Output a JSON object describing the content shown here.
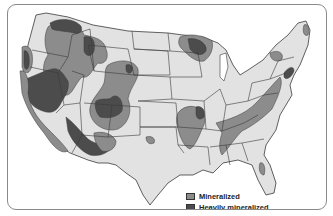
{
  "map": {
    "title": "Mineralized regions of the conterminous United States",
    "caption_partial": "",
    "colors": {
      "land": "#e2e2e2",
      "state_border": "#3a3a3a",
      "mineralized": "#8c8c8c",
      "heavily_mineralized": "#4c4c4c",
      "water": "#ffffff"
    },
    "legend": {
      "items": [
        {
          "label": "Mineralized",
          "category": "mineralized"
        },
        {
          "label": "Heavily mineralized",
          "category": "heavily_mineralized"
        }
      ]
    },
    "regions": [
      {
        "name": "Northern Rockies / Idaho-Montana belt",
        "category": "mineralized"
      },
      {
        "name": "Northern Idaho / NE Washington",
        "category": "heavily_mineralized"
      },
      {
        "name": "Western Montana",
        "category": "heavily_mineralized"
      },
      {
        "name": "Oregon Cascades",
        "category": "mineralized"
      },
      {
        "name": "Klamath / Western Oregon",
        "category": "heavily_mineralized"
      },
      {
        "name": "Great Basin (Nevada)",
        "category": "heavily_mineralized"
      },
      {
        "name": "Sierra Nevada / California",
        "category": "mineralized"
      },
      {
        "name": "Colorado Mineral Belt",
        "category": "mineralized"
      },
      {
        "name": "Central Colorado",
        "category": "heavily_mineralized"
      },
      {
        "name": "Black Hills / Wyoming",
        "category": "heavily_mineralized"
      },
      {
        "name": "Arizona / Southern California",
        "category": "heavily_mineralized"
      },
      {
        "name": "Southwest New Mexico",
        "category": "mineralized"
      },
      {
        "name": "Lake Superior region",
        "category": "mineralized"
      },
      {
        "name": "Upper Peninsula / N. Wisconsin",
        "category": "heavily_mineralized"
      },
      {
        "name": "Ozarks / Southeast Missouri",
        "category": "mineralized"
      },
      {
        "name": "Southeast Missouri Lead Belt",
        "category": "heavily_mineralized"
      },
      {
        "name": "Appalachians",
        "category": "mineralized"
      },
      {
        "name": "Southern Oklahoma",
        "category": "mineralized"
      },
      {
        "name": "Adirondacks",
        "category": "mineralized"
      },
      {
        "name": "Northern Maine",
        "category": "mineralized"
      },
      {
        "name": "Northeast Florida coast",
        "category": "mineralized"
      },
      {
        "name": "New Jersey / Pennsylvania",
        "category": "heavily_mineralized"
      }
    ]
  }
}
